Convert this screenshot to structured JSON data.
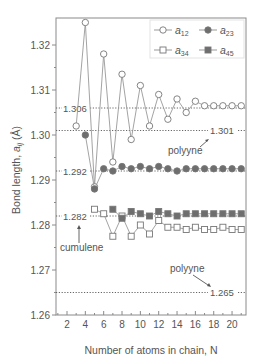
{
  "chart_data": {
    "type": "line",
    "title": "",
    "xlabel": "Number of atoms in chain, N",
    "ylabel": "Bond length, a_ij (Å)",
    "ylabel_main": "Bond length, ",
    "ylabel_sym": "a",
    "ylabel_sub": "ij",
    "ylabel_unit": " (Å)",
    "xlim": [
      1,
      21
    ],
    "ylim": [
      1.26,
      1.326
    ],
    "x_ticks": [
      2,
      4,
      6,
      8,
      10,
      12,
      14,
      16,
      18,
      20
    ],
    "y_ticks": [
      1.26,
      1.27,
      1.28,
      1.29,
      1.3,
      1.31,
      1.32
    ],
    "y_tick_labels": [
      "1.26",
      "1.27",
      "1.28",
      "1.29",
      "1.30",
      "1.31",
      "1.32"
    ],
    "grid": false,
    "legend_position": "upper right",
    "series": [
      {
        "name": "a12",
        "label": "a",
        "sub": "12",
        "marker": "open-circle",
        "x": [
          3,
          4,
          5,
          6,
          7,
          8,
          9,
          10,
          11,
          12,
          13,
          14,
          15,
          16,
          17,
          18,
          19,
          20,
          21
        ],
        "values": [
          1.302,
          1.325,
          1.2885,
          1.318,
          1.294,
          1.3135,
          1.299,
          1.311,
          1.302,
          1.309,
          1.3035,
          1.308,
          1.305,
          1.3075,
          1.3065,
          1.3065,
          1.3065,
          1.3065,
          1.3065
        ]
      },
      {
        "name": "a23",
        "label": "a",
        "sub": "23",
        "marker": "filled-circle",
        "x": [
          4,
          5,
          6,
          7,
          8,
          9,
          10,
          11,
          12,
          13,
          14,
          15,
          16,
          17,
          18,
          19,
          20,
          21
        ],
        "values": [
          1.3,
          1.288,
          1.2925,
          1.292,
          1.293,
          1.2925,
          1.293,
          1.2925,
          1.293,
          1.2925,
          1.292,
          1.2925,
          1.2925,
          1.2925,
          1.2925,
          1.2925,
          1.2925,
          1.2925
        ]
      },
      {
        "name": "a34",
        "label": "a",
        "sub": "34",
        "marker": "open-square",
        "x": [
          5,
          6,
          7,
          8,
          9,
          10,
          11,
          12,
          13,
          14,
          15,
          16,
          17,
          18,
          19,
          20,
          21
        ],
        "values": [
          1.2835,
          1.2825,
          1.2775,
          1.282,
          1.2775,
          1.28,
          1.278,
          1.281,
          1.2795,
          1.2795,
          1.279,
          1.2795,
          1.279,
          1.279,
          1.2795,
          1.279,
          1.279
        ]
      },
      {
        "name": "a45",
        "label": "a",
        "sub": "45",
        "marker": "filled-square",
        "x": [
          7,
          8,
          9,
          10,
          11,
          12,
          13,
          14,
          15,
          16,
          17,
          18,
          19,
          20,
          21
        ],
        "values": [
          1.2835,
          1.2815,
          1.283,
          1.2825,
          1.282,
          1.283,
          1.2825,
          1.282,
          1.2825,
          1.2825,
          1.2825,
          1.2825,
          1.2825,
          1.2825,
          1.2825
        ]
      }
    ],
    "reference_lines": [
      {
        "value": 1.306,
        "label": "1.306",
        "label_side": "left"
      },
      {
        "value": 1.301,
        "label": "1.301",
        "label_side": "right"
      },
      {
        "value": 1.292,
        "label": "1.292",
        "label_side": "left"
      },
      {
        "value": 1.282,
        "label": "1.282",
        "label_side": "left"
      },
      {
        "value": 1.265,
        "label": "1.265",
        "label_side": "right"
      }
    ],
    "annotations": [
      {
        "text": "polyyne",
        "target": "1.301"
      },
      {
        "text": "cumulene",
        "target": "1.282"
      },
      {
        "text": "polyyne",
        "target": "1.265"
      }
    ]
  }
}
